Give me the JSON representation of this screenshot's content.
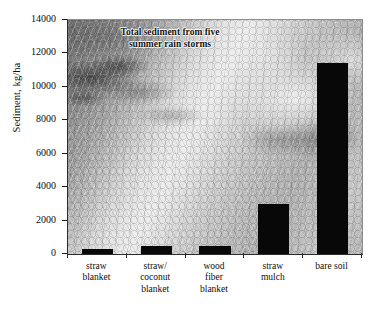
{
  "chart_data": {
    "type": "bar",
    "title": "Total sediment from five summer rain storms",
    "title_lines": [
      "Total sediment from five",
      "summer rain storms"
    ],
    "categories": [
      "straw blanket",
      "straw/ coconut blanket",
      "wood fiber blanket",
      "straw mulch",
      "bare soil"
    ],
    "category_lines": [
      [
        "straw",
        "blanket"
      ],
      [
        "straw/",
        "coconut",
        "blanket"
      ],
      [
        "wood",
        "fiber",
        "blanket"
      ],
      [
        "straw",
        "mulch"
      ],
      [
        "bare soil"
      ]
    ],
    "values": [
      300,
      450,
      450,
      3000,
      11400
    ],
    "xlabel": "",
    "ylabel": "Sediment, kg/ha",
    "ylim": [
      0,
      14000
    ],
    "ytick_values": [
      0,
      2000,
      4000,
      6000,
      8000,
      10000,
      12000,
      14000
    ],
    "ytick_labels": [
      "0",
      "2000",
      "4000",
      "6000",
      "8000",
      "10000",
      "12000",
      "14000"
    ],
    "grid": false,
    "legend": false,
    "bar_color": "#080808",
    "axis_color": "#2b2b2b",
    "background": "grayscale-photograph-of-eroded-slope-with-straw-matting"
  }
}
